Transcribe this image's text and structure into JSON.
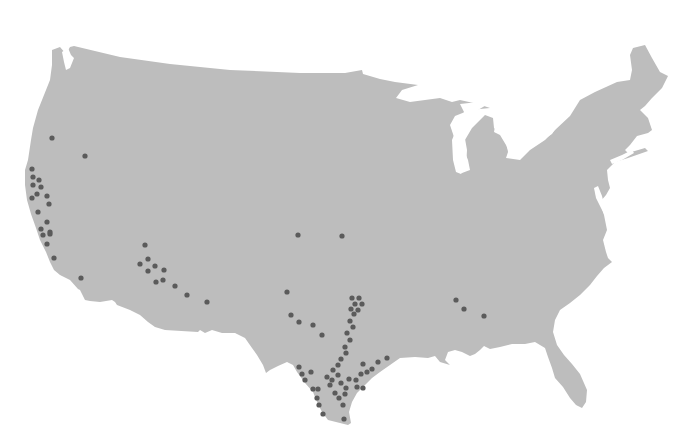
{
  "map": {
    "region": "Contiguous United States",
    "land_color": "#bdbdbd",
    "background_color": "#ffffff",
    "marker_color": "#5b5b5b",
    "marker_radius": 2.6,
    "marker_icon": "circle-dot-icon"
  },
  "markers": [
    {
      "x": 52,
      "y": 138
    },
    {
      "x": 85,
      "y": 156
    },
    {
      "x": 32,
      "y": 169
    },
    {
      "x": 33,
      "y": 177
    },
    {
      "x": 39,
      "y": 180
    },
    {
      "x": 33,
      "y": 185
    },
    {
      "x": 41,
      "y": 187
    },
    {
      "x": 37,
      "y": 194
    },
    {
      "x": 47,
      "y": 196
    },
    {
      "x": 32,
      "y": 198
    },
    {
      "x": 49,
      "y": 204
    },
    {
      "x": 38,
      "y": 212
    },
    {
      "x": 47,
      "y": 222
    },
    {
      "x": 41,
      "y": 229
    },
    {
      "x": 50,
      "y": 232
    },
    {
      "x": 43,
      "y": 235
    },
    {
      "x": 50,
      "y": 234
    },
    {
      "x": 47,
      "y": 244
    },
    {
      "x": 54,
      "y": 258
    },
    {
      "x": 81,
      "y": 278
    },
    {
      "x": 145,
      "y": 245
    },
    {
      "x": 148,
      "y": 259
    },
    {
      "x": 140,
      "y": 264
    },
    {
      "x": 155,
      "y": 266
    },
    {
      "x": 148,
      "y": 271
    },
    {
      "x": 164,
      "y": 270
    },
    {
      "x": 156,
      "y": 282
    },
    {
      "x": 163,
      "y": 280
    },
    {
      "x": 175,
      "y": 286
    },
    {
      "x": 187,
      "y": 295
    },
    {
      "x": 207,
      "y": 302
    },
    {
      "x": 298,
      "y": 235
    },
    {
      "x": 342,
      "y": 236
    },
    {
      "x": 287,
      "y": 292
    },
    {
      "x": 291,
      "y": 315
    },
    {
      "x": 299,
      "y": 322
    },
    {
      "x": 313,
      "y": 325
    },
    {
      "x": 322,
      "y": 335
    },
    {
      "x": 352,
      "y": 298
    },
    {
      "x": 359,
      "y": 298
    },
    {
      "x": 355,
      "y": 304
    },
    {
      "x": 362,
      "y": 304
    },
    {
      "x": 351,
      "y": 309
    },
    {
      "x": 358,
      "y": 310
    },
    {
      "x": 354,
      "y": 314
    },
    {
      "x": 350,
      "y": 321
    },
    {
      "x": 353,
      "y": 327
    },
    {
      "x": 347,
      "y": 333
    },
    {
      "x": 350,
      "y": 340
    },
    {
      "x": 345,
      "y": 347
    },
    {
      "x": 346,
      "y": 353
    },
    {
      "x": 341,
      "y": 359
    },
    {
      "x": 338,
      "y": 365
    },
    {
      "x": 333,
      "y": 370
    },
    {
      "x": 338,
      "y": 375
    },
    {
      "x": 327,
      "y": 377
    },
    {
      "x": 332,
      "y": 380
    },
    {
      "x": 341,
      "y": 383
    },
    {
      "x": 349,
      "y": 379
    },
    {
      "x": 346,
      "y": 388
    },
    {
      "x": 356,
      "y": 380
    },
    {
      "x": 361,
      "y": 374
    },
    {
      "x": 367,
      "y": 372
    },
    {
      "x": 372,
      "y": 369
    },
    {
      "x": 387,
      "y": 358
    },
    {
      "x": 378,
      "y": 362
    },
    {
      "x": 363,
      "y": 364
    },
    {
      "x": 299,
      "y": 367
    },
    {
      "x": 302,
      "y": 374
    },
    {
      "x": 305,
      "y": 380
    },
    {
      "x": 311,
      "y": 372
    },
    {
      "x": 313,
      "y": 389
    },
    {
      "x": 318,
      "y": 389
    },
    {
      "x": 317,
      "y": 398
    },
    {
      "x": 319,
      "y": 405
    },
    {
      "x": 323,
      "y": 414
    },
    {
      "x": 330,
      "y": 385
    },
    {
      "x": 335,
      "y": 393
    },
    {
      "x": 339,
      "y": 398
    },
    {
      "x": 345,
      "y": 394
    },
    {
      "x": 343,
      "y": 405
    },
    {
      "x": 344,
      "y": 419
    },
    {
      "x": 357,
      "y": 387
    },
    {
      "x": 363,
      "y": 388
    },
    {
      "x": 456,
      "y": 300
    },
    {
      "x": 464,
      "y": 309
    },
    {
      "x": 484,
      "y": 316
    }
  ]
}
